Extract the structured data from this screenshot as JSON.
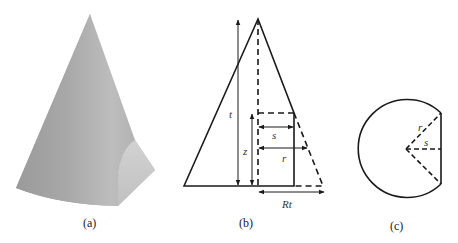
{
  "figure": {
    "panels": [
      {
        "id": "a",
        "caption": "(a)",
        "description": "shaded cone truncated by a vertical plane"
      },
      {
        "id": "b",
        "caption": "(b)",
        "description": "side cross-section of cone with cut"
      },
      {
        "id": "c",
        "caption": "(c)",
        "description": "horizontal cross-section: circle with chord cut"
      }
    ],
    "panel_b_labels": {
      "t": "t",
      "z": "z",
      "s": "s",
      "r": "r",
      "Rt": "Rt"
    },
    "panel_c_labels": {
      "r": "r",
      "s": "s"
    },
    "colors": {
      "line": "#1a1a1a",
      "cone_shade_light": "#c8c8c8",
      "cone_shade_dark": "#8a8a8a"
    }
  }
}
